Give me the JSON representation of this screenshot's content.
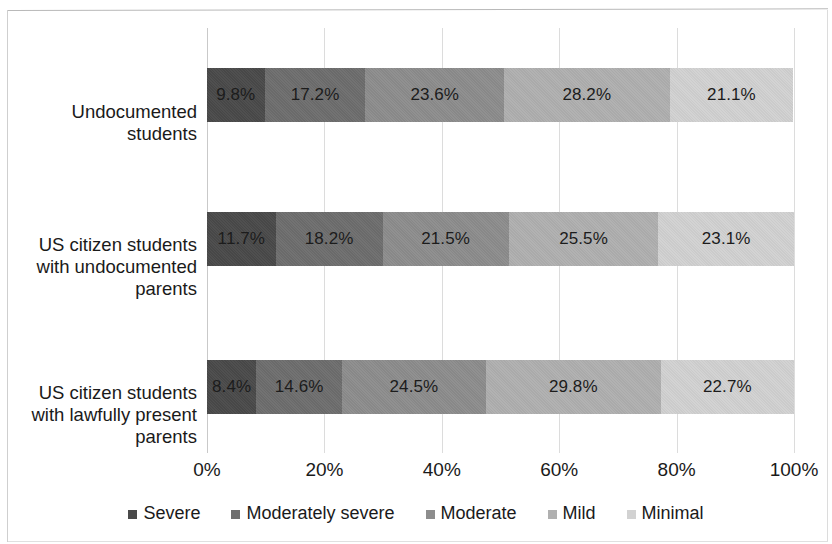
{
  "chart_data": {
    "type": "bar",
    "subtype": "stacked-horizontal-100-percent",
    "title": "",
    "xlabel": "",
    "ylabel": "",
    "xlim": [
      0,
      100
    ],
    "xticks": [
      "0%",
      "20%",
      "40%",
      "60%",
      "80%",
      "100%"
    ],
    "xtick_values": [
      0,
      20,
      40,
      60,
      80,
      100
    ],
    "grid": "vertical",
    "legend_position": "bottom",
    "categories": [
      "Undocumented students",
      "US citizen students with undocumented parents",
      "US citizen students with lawfully present parents"
    ],
    "category_label_lines": [
      [
        "Undocumented",
        "students"
      ],
      [
        "US citizen students",
        "with undocumented",
        "parents"
      ],
      [
        "US citizen students",
        "with lawfully present",
        "parents"
      ]
    ],
    "series": [
      {
        "name": "Severe",
        "color": "#4a4a4a",
        "values": [
          9.8,
          11.7,
          8.4
        ],
        "labels": [
          "9.8%",
          "11.7%",
          "8.4%"
        ]
      },
      {
        "name": "Moderately severe",
        "color": "#6e6e6e",
        "values": [
          17.2,
          18.2,
          14.6
        ],
        "labels": [
          "17.2%",
          "18.2%",
          "14.6%"
        ]
      },
      {
        "name": "Moderate",
        "color": "#8d8d8d",
        "values": [
          23.6,
          21.5,
          24.5
        ],
        "labels": [
          "23.6%",
          "21.5%",
          "24.5%"
        ]
      },
      {
        "name": "Mild",
        "color": "#b0b0b0",
        "values": [
          28.2,
          25.5,
          29.8
        ],
        "labels": [
          "28.2%",
          "25.5%",
          "29.8%"
        ]
      },
      {
        "name": "Minimal",
        "color": "#d2d2d2",
        "values": [
          21.1,
          23.1,
          22.7
        ],
        "labels": [
          "21.1%",
          "23.1%",
          "22.7%"
        ]
      }
    ],
    "legend_entries": [
      {
        "label": "Severe",
        "color": "#4a4a4a"
      },
      {
        "label": "Moderately severe",
        "color": "#6e6e6e"
      },
      {
        "label": "Moderate",
        "color": "#8d8d8d"
      },
      {
        "label": "Mild",
        "color": "#b0b0b0"
      },
      {
        "label": "Minimal",
        "color": "#d2d2d2"
      }
    ]
  }
}
